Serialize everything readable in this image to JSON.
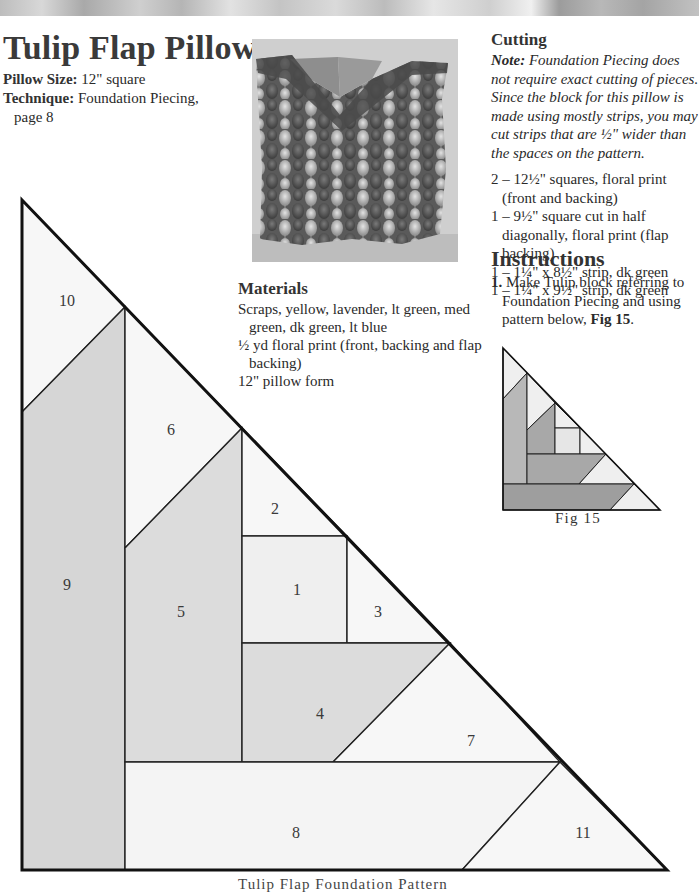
{
  "header": {
    "title": "Tulip Flap Pillow",
    "pillow_size_label": "Pillow Size:",
    "pillow_size_value": "12\" square",
    "technique_label": "Technique:",
    "technique_value": "Foundation Piecing,",
    "technique_page": "page 8"
  },
  "photo": {
    "description": "Tulip print pillow with pieced flap"
  },
  "materials": {
    "heading": "Materials",
    "items": [
      "Scraps, yellow, lavender, lt green, med green, dk green, lt blue",
      "½ yd floral print (front, backing and flap backing)",
      "12\" pillow form"
    ]
  },
  "cutting": {
    "heading": "Cutting",
    "note_label": "Note:",
    "note_text": "Foundation Piecing does not require exact cutting of pieces. Since the block for this pillow is made using mostly strips, you may cut strips that are ½\" wider than the spaces on the pattern.",
    "items": [
      "2 – 12½\" squares, floral print (front and backing)",
      "1 – 9½\" square cut in half diagonally, floral print (flap backing)",
      "1 – 1¼\" x 8½\" strip, dk green",
      "1 – 1¼\" x 9½\" strip, dk green"
    ]
  },
  "instructions": {
    "heading": "Instructions",
    "steps": [
      {
        "number": "1.",
        "text": "Make Tulip block referring to Foundation Piecing and using pattern below, ",
        "ref": "Fig 15",
        "end": "."
      }
    ]
  },
  "figure": {
    "caption": "Fig 15"
  },
  "pattern": {
    "caption": "Tulip Flap Foundation Pattern",
    "pieces": [
      "1",
      "2",
      "3",
      "4",
      "5",
      "6",
      "7",
      "8",
      "9",
      "10",
      "11"
    ]
  },
  "colors": {
    "light_fill": "#f6f6f6",
    "mid_fill": "#dedede",
    "dark_fill": "#d3d3d3",
    "fig_light": "#efefef",
    "fig_mid": "#b8b8b8",
    "fig_dark": "#9e9e9e",
    "outline": "#111111"
  }
}
